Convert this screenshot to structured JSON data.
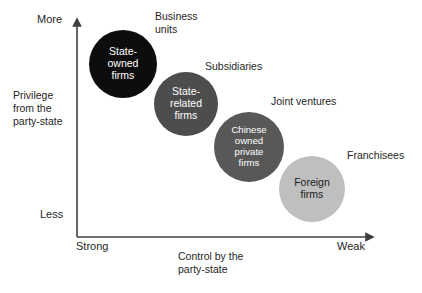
{
  "figure": {
    "axes": {
      "y_axis": {
        "name": "Privilege from the party-state",
        "caption": "Privilege\nfrom the\nparty-state",
        "high_label": "More",
        "low_label": "Less"
      },
      "x_axis": {
        "name": "Control by the party-state",
        "caption": "Control by the\nparty-state",
        "low_label": "Strong",
        "high_label": "Weak"
      }
    },
    "bubbles": [
      {
        "id": "state-owned-firms",
        "label": "State-\nowned\nfirms",
        "color": "#0d0d0d",
        "text_color": "#ffffff",
        "cx": 123,
        "cy": 64,
        "r": 34,
        "font_size": 10.5
      },
      {
        "id": "state-related-firms",
        "label": "State-\nrelated\nfirms",
        "color": "#4d4d4d",
        "text_color": "#ffffff",
        "cx": 186,
        "cy": 104,
        "r": 32,
        "font_size": 10.5
      },
      {
        "id": "chinese-owned-private-firms",
        "label": "Chinese\nowned\nprivate\nfirms",
        "color": "#585858",
        "text_color": "#ffffff",
        "cx": 249,
        "cy": 147,
        "r": 35,
        "font_size": 9.6
      },
      {
        "id": "foreign-firms",
        "label": "Foreign\nfirms",
        "color": "#bfbfbf",
        "text_color": "#1a1a1a",
        "cx": 312,
        "cy": 189,
        "r": 33,
        "font_size": 10.5
      }
    ],
    "annotations": [
      {
        "id": "business-units",
        "text": "Business\nunits",
        "x": 155,
        "y": 10
      },
      {
        "id": "subsidiaries",
        "text": "Subsidiaries",
        "x": 205,
        "y": 60
      },
      {
        "id": "joint-ventures",
        "text": "Joint ventures",
        "x": 271,
        "y": 95
      },
      {
        "id": "franchisees",
        "text": "Franchisees",
        "x": 347,
        "y": 149
      }
    ],
    "colors": {
      "axis_line": "#3f3f3f",
      "text": "#262626",
      "background": "#ffffff"
    }
  }
}
